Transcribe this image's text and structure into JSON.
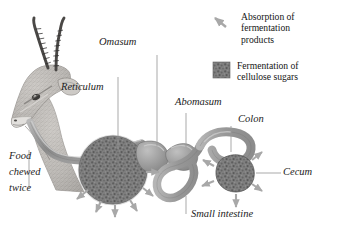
{
  "figure": {
    "kind": "biology-diagram",
    "background": "#ffffff",
    "ink": "#1c1c1c",
    "tissue_fill": "#9a9a9a",
    "tissue_stroke": "#6d6d6d",
    "ferment_fill": "#7d7d7d",
    "ferment_stroke": "#5a5a5a",
    "arrow_color": "#a8a8a8",
    "leader_color": "#9a9a9a"
  },
  "labels": [
    {
      "id": "omasum",
      "text": "Omasum"
    },
    {
      "id": "reticulum",
      "text": "Reticulum"
    },
    {
      "id": "abomasum",
      "text": "Abomasum"
    },
    {
      "id": "colon",
      "text": "Colon"
    },
    {
      "id": "cecum",
      "text": "Cecum"
    },
    {
      "id": "small_intestine",
      "text": "Small intestine"
    },
    {
      "id": "food_line1",
      "text": "Food"
    },
    {
      "id": "food_line2",
      "text": "chewed"
    },
    {
      "id": "food_line3",
      "text": "twice"
    }
  ],
  "legend": {
    "items": [
      {
        "icon": "arrow-icon",
        "icon_kind": "arrow",
        "color": "#a8a8a8",
        "lines": [
          "Absorption of",
          "fermentation",
          "products"
        ]
      },
      {
        "icon": "stipple-square-icon",
        "icon_kind": "swatch",
        "color": "#7d7d7d",
        "lines": [
          "Fermentation of",
          "cellulose sugars"
        ]
      }
    ]
  },
  "anatomy": {
    "parts": [
      {
        "name": "gazelle-head",
        "role": "animal illustration"
      },
      {
        "name": "esophagus",
        "role": "tube from mouth to rumen"
      },
      {
        "name": "rumen",
        "role": "fermentation chamber",
        "fermentation": true
      },
      {
        "name": "reticulum",
        "role": "small pouch beside rumen"
      },
      {
        "name": "omasum",
        "role": "bulbous chamber"
      },
      {
        "name": "abomasum",
        "role": "true stomach"
      },
      {
        "name": "small-intestine",
        "role": "looped tube"
      },
      {
        "name": "colon",
        "role": "large intestine"
      },
      {
        "name": "cecum",
        "role": "fermentation pouch",
        "fermentation": true
      }
    ],
    "absorption_arrow_counts": {
      "rumen": 6,
      "cecum": 5
    }
  }
}
